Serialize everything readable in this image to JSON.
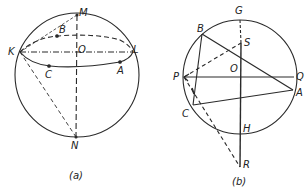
{
  "figure": {
    "ink_color": "#2a2a2a",
    "background": "#ffffff",
    "panels": [
      {
        "id": "a",
        "caption": "(a)",
        "description": "Sphere with center O, poles M and N, equator through K and L with points A, B, C; dashed lines from K to M and K to N",
        "points": {
          "M": "M",
          "B": "B",
          "K": "K",
          "O": "O",
          "L": "L",
          "C": "C",
          "A": "A",
          "N": "N"
        }
      },
      {
        "id": "b",
        "caption": "(b)",
        "description": "Circle with center O, diameter GH extended to R, diameter PQ, inscribed triangle ABC, point S on GO, dashed lines P-S and P-R",
        "points": {
          "G": "G",
          "B": "B",
          "S": "S",
          "P": "P",
          "O": "O",
          "Q": "Q",
          "A": "A",
          "C": "C",
          "H": "H",
          "R": "R"
        }
      }
    ]
  }
}
